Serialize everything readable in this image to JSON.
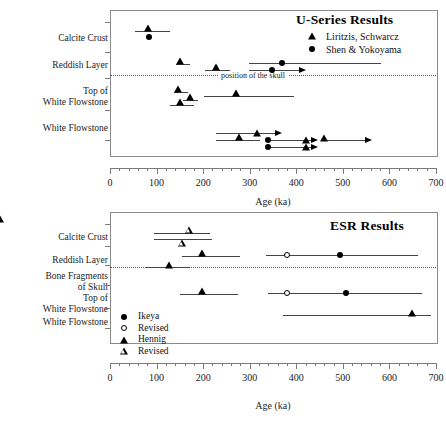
{
  "figure": {
    "axis_title": "Age (ka)",
    "skull_annotation": "position of the skull",
    "x_ticks": [
      "0",
      "100",
      "200",
      "300",
      "400",
      "500",
      "600",
      "700"
    ]
  },
  "panels": {
    "useries": {
      "title": "U-Series  Results",
      "categories": [
        {
          "label": "Calcite Crust"
        },
        {
          "label": "Reddish Layer"
        },
        {
          "label": "Top of\nWhite Flowstone"
        },
        {
          "label": "White Flowstone"
        }
      ],
      "legend": [
        {
          "symbol": "filled-triangle",
          "label": "Liritzis, Schwarcz"
        },
        {
          "symbol": "filled-circle",
          "label": "Shen & Yokoyama"
        }
      ]
    },
    "esr": {
      "title": "ESR  Results",
      "categories": [
        {
          "label": "Calcite Crust"
        },
        {
          "label": "Reddish Layer"
        },
        {
          "label": "Bone Fragments\nof Skull"
        },
        {
          "label": "Top of\nWhite Flowstone"
        },
        {
          "label": "White Flowstone"
        }
      ],
      "legend": [
        {
          "symbol": "filled-circle",
          "label": "Ikeya"
        },
        {
          "symbol": "open-circle",
          "label": "Revised"
        },
        {
          "symbol": "filled-triangle",
          "label": "Hennig"
        },
        {
          "symbol": "open-triangle",
          "label": "Revised"
        }
      ]
    }
  },
  "chart_data": {
    "type": "scatter",
    "xlabel": "Age (ka)",
    "ylabel": "",
    "xlim": [
      0,
      700
    ],
    "x_major_step": 100,
    "x_minor_step": 20,
    "grid": false,
    "legend_position": "inside",
    "subplots": [
      {
        "title": "U-Series  Results",
        "categories": [
          "Calcite Crust",
          "Reddish Layer",
          "Top of White Flowstone",
          "White Flowstone"
        ],
        "annotation": {
          "text": "position of the skull",
          "between": [
            "Reddish Layer",
            "Top of White Flowstone"
          ],
          "style": "dotted"
        },
        "series": [
          {
            "name": "Liritzis, Schwarcz",
            "marker": "filled-triangle",
            "points": [
              {
                "category": "Calcite Crust",
                "sub": 0,
                "age": 83,
                "low": 55,
                "high": 130,
                "arrow": false
              },
              {
                "category": "Reddish Layer",
                "sub": 0,
                "age": 151,
                "low": 143,
                "high": 172,
                "arrow": false
              },
              {
                "category": "Reddish Layer",
                "sub": 1,
                "age": 230,
                "low": 205,
                "high": 258,
                "arrow": false
              },
              {
                "category": "Top of White Flowstone",
                "sub": 0,
                "age": 148,
                "low": 138,
                "high": 165,
                "arrow": false
              },
              {
                "category": "Top of White Flowstone",
                "sub": 1,
                "age": 273,
                "low": 203,
                "high": 395,
                "arrow": false
              },
              {
                "category": "Top of White Flowstone",
                "sub": 2,
                "age": 173,
                "low": 160,
                "high": 190,
                "arrow": false
              },
              {
                "category": "Top of White Flowstone",
                "sub": 3,
                "age": 152,
                "low": 128,
                "high": 178,
                "arrow": false
              },
              {
                "category": "White Flowstone",
                "sub": 0,
                "age": 277,
                "low": 228,
                "high": 320,
                "arrow": false
              },
              {
                "category": "White Flowstone",
                "sub": 1,
                "age": 318,
                "low": 300,
                "high": 420,
                "arrow": true
              },
              {
                "category": "White Flowstone",
                "sub": 2,
                "age": 412,
                "low": 350,
                "high": 430,
                "arrow": true
              },
              {
                "category": "White Flowstone",
                "sub": 3,
                "age": 415,
                "low": 350,
                "high": 430,
                "arrow": true
              },
              {
                "category": "White Flowstone",
                "sub": 4,
                "age": 450,
                "low": 440,
                "high": 520,
                "arrow": true
              }
            ]
          },
          {
            "name": "Shen & Yokoyama",
            "marker": "filled-circle",
            "points": [
              {
                "category": "Calcite Crust",
                "sub": 0,
                "age": 84,
                "low": 55,
                "high": 130,
                "arrow": false
              },
              {
                "category": "Reddish Layer",
                "sub": 0,
                "age": 371,
                "low": 298,
                "high": 582,
                "arrow": false
              },
              {
                "category": "Reddish Layer",
                "sub": 1,
                "age": 350,
                "low": 298,
                "high": 410,
                "arrow": true
              },
              {
                "category": "White Flowstone",
                "sub": 0,
                "age": 350,
                "low": 350,
                "high": 430,
                "arrow": true
              },
              {
                "category": "White Flowstone",
                "sub": 1,
                "age": 350,
                "low": 350,
                "high": 430,
                "arrow": true
              }
            ]
          }
        ]
      },
      {
        "title": "ESR  Results",
        "categories": [
          "Calcite Crust",
          "Reddish Layer",
          "Bone Fragments of Skull",
          "Top of White Flowstone",
          "White Flowstone"
        ],
        "annotation": {
          "text": "",
          "between": [
            "Reddish Layer",
            "Bone Fragments of Skull"
          ],
          "style": "dotted"
        },
        "series": [
          {
            "name": "Ikeya",
            "marker": "filled-circle",
            "points": [
              {
                "category": "Reddish Layer",
                "sub": 0,
                "age": 495,
                "low": 337,
                "high": 675,
                "arrow": false
              },
              {
                "category": "Top of White Flowstone",
                "sub": 0,
                "age": 508,
                "low": 340,
                "high": 680,
                "arrow": false
              }
            ]
          },
          {
            "name": "Revised",
            "marker": "open-circle",
            "points": [
              {
                "category": "Reddish Layer",
                "sub": 0,
                "age": 380,
                "low": 337,
                "high": 580,
                "arrow": false
              },
              {
                "category": "Top of White Flowstone",
                "sub": 0,
                "age": 380,
                "low": 340,
                "high": 580,
                "arrow": false
              }
            ]
          },
          {
            "name": "Hennig",
            "marker": "filled-triangle",
            "points": [
              {
                "category": "Calcite Crust",
                "sub": 0,
                "age": 198,
                "low": 150,
                "high": 240,
                "arrow": false
              },
              {
                "category": "Reddish Layer",
                "sub": 0,
                "age": 197,
                "low": 155,
                "high": 245,
                "arrow": false
              },
              {
                "category": "Bone Fragments of Skull",
                "sub": 0,
                "age": 127,
                "low": 78,
                "high": 175,
                "arrow": false
              },
              {
                "category": "Top of White Flowstone",
                "sub": 0,
                "age": 198,
                "low": 150,
                "high": 245,
                "arrow": false
              },
              {
                "category": "White Flowstone",
                "sub": 0,
                "age": 650,
                "low": 370,
                "high": 690,
                "arrow": false
              }
            ]
          },
          {
            "name": "Revised",
            "marker": "open-triangle",
            "points": [
              {
                "category": "Calcite Crust",
                "sub": 0,
                "age": 170,
                "low": 95,
                "high": 215,
                "arrow": false
              },
              {
                "category": "Calcite Crust",
                "sub": 1,
                "age": 157,
                "low": 120,
                "high": 205,
                "arrow": false
              }
            ]
          }
        ]
      }
    ]
  }
}
